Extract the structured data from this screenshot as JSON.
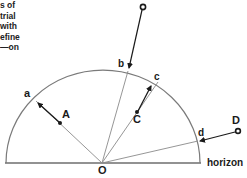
{
  "caption": {
    "lines": [
      "s of",
      "trial",
      "with",
      "efine",
      "—on"
    ]
  },
  "diagram": {
    "labels": {
      "a": "a",
      "b": "b",
      "c": "c",
      "d": "d",
      "A": "A",
      "C": "C",
      "D": "D",
      "O": "O",
      "horizon": "horizon"
    },
    "colors": {
      "line": "#7a7a7a",
      "arrow": "#1a1a1a",
      "text": "#1a1a1a"
    }
  }
}
